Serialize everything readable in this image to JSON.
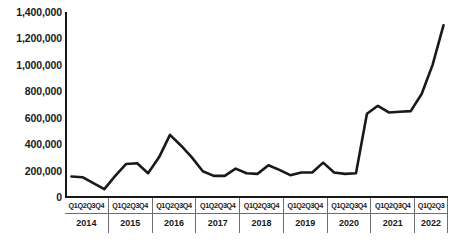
{
  "chart_data": {
    "type": "line",
    "title": "",
    "subtitle": "",
    "xlabel": "",
    "ylabel": "",
    "ylim": [
      0,
      1400000
    ],
    "grid": false,
    "legend": "none",
    "y_ticks": [
      "1,400,000",
      "1,200,000",
      "1,000,000",
      "800,000",
      "600,000",
      "400,000",
      "200,000",
      "0"
    ],
    "y_tick_values": [
      1400000,
      1200000,
      1000000,
      800000,
      600000,
      400000,
      200000,
      0
    ],
    "year_groups": [
      {
        "year": "2014",
        "quarters": [
          "Q1",
          "Q2",
          "Q3",
          "Q4"
        ]
      },
      {
        "year": "2015",
        "quarters": [
          "Q1",
          "Q2",
          "Q3",
          "Q4"
        ]
      },
      {
        "year": "2016",
        "quarters": [
          "Q1",
          "Q2",
          "Q3",
          "Q4"
        ]
      },
      {
        "year": "2017",
        "quarters": [
          "Q1",
          "Q2",
          "Q3",
          "Q4"
        ]
      },
      {
        "year": "2018",
        "quarters": [
          "Q1",
          "Q2",
          "Q3",
          "Q4"
        ]
      },
      {
        "year": "2019",
        "quarters": [
          "Q1",
          "Q2",
          "Q3",
          "Q4"
        ]
      },
      {
        "year": "2020",
        "quarters": [
          "Q1",
          "Q2",
          "Q3",
          "Q4"
        ]
      },
      {
        "year": "2021",
        "quarters": [
          "Q1",
          "Q2",
          "Q3",
          "Q4"
        ]
      },
      {
        "year": "2022",
        "quarters": [
          "Q1",
          "Q2",
          "Q3"
        ]
      }
    ],
    "x": [
      "2014 Q1",
      "2014 Q2",
      "2014 Q3",
      "2014 Q4",
      "2015 Q1",
      "2015 Q2",
      "2015 Q3",
      "2015 Q4",
      "2016 Q1",
      "2016 Q2",
      "2016 Q3",
      "2016 Q4",
      "2017 Q1",
      "2017 Q2",
      "2017 Q3",
      "2017 Q4",
      "2018 Q1",
      "2018 Q2",
      "2018 Q3",
      "2018 Q4",
      "2019 Q1",
      "2019 Q2",
      "2019 Q3",
      "2019 Q4",
      "2020 Q1",
      "2020 Q2",
      "2020 Q3",
      "2020 Q4",
      "2021 Q1",
      "2021 Q2",
      "2021 Q3",
      "2021 Q4",
      "2022 Q1",
      "2022 Q2",
      "2022 Q3"
    ],
    "values": [
      155000,
      150000,
      105000,
      60000,
      160000,
      250000,
      255000,
      180000,
      300000,
      470000,
      390000,
      300000,
      195000,
      160000,
      160000,
      215000,
      180000,
      175000,
      240000,
      205000,
      165000,
      185000,
      185000,
      260000,
      185000,
      175000,
      180000,
      630000,
      690000,
      640000,
      645000,
      650000,
      780000,
      1000000,
      1300000
    ],
    "line_color": "#19191c",
    "axis_color": "#19191c",
    "background_color": "#ffffff"
  }
}
